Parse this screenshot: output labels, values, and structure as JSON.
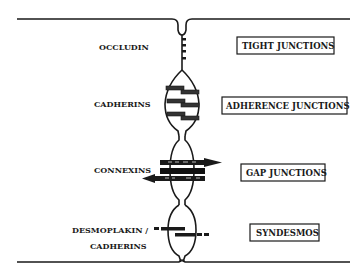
{
  "diagram": {
    "left_labels": {
      "occludin": "OCCLUDIN",
      "cadherins": "CADHERINS",
      "connexins": "CONNEXINS",
      "desmoplakin": "DESMOPLAKIN /",
      "desmoplakin_cadherins": "CADHERINS"
    },
    "right_boxes": {
      "tight": "TIGHT JUNCTIONS",
      "adherence": "ADHERENCE JUNCTIONS",
      "gap": "GAP JUNCTIONS",
      "syndesmos": "SYNDESMOS"
    },
    "colors": {
      "ink": "#1a1a1a",
      "background": "#ffffff"
    }
  }
}
